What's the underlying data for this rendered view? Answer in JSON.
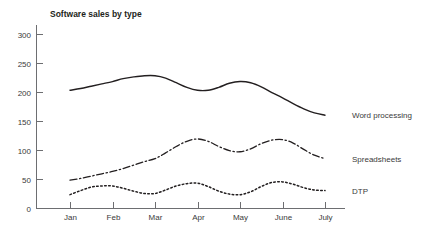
{
  "chart_data": {
    "type": "line",
    "title": "Software sales by type",
    "xlabel": "",
    "ylabel": "",
    "grid": false,
    "legend_position": "right-inline-end-of-line",
    "categories": [
      "Jan",
      "Feb",
      "Mar",
      "Apr",
      "May",
      "June",
      "July"
    ],
    "xtick_labels": [
      "Jan",
      "Feb",
      "Mar",
      "Apr",
      "May",
      "June",
      "July"
    ],
    "ytick_labels": [
      "0",
      "50",
      "100",
      "150",
      "200",
      "250",
      "300"
    ],
    "ytick_values": [
      0,
      50,
      100,
      150,
      200,
      250,
      300
    ],
    "ylim": [
      0,
      315
    ],
    "series": [
      {
        "name": "Word processing",
        "label": "Word processing",
        "line_style": "solid",
        "color": "#231f20",
        "values": [
          203,
          218,
          228,
          205,
          218,
          190,
          160
        ],
        "dense_x": [
          0,
          0.25,
          0.5,
          0.75,
          1,
          1.25,
          1.5,
          1.75,
          2,
          2.25,
          2.5,
          2.75,
          3,
          3.25,
          3.5,
          3.75,
          4,
          4.25,
          4.5,
          4.75,
          5,
          5.25,
          5.5,
          5.75,
          6
        ],
        "dense_y": [
          203,
          206,
          210,
          214,
          218,
          223,
          226,
          228,
          228,
          224,
          216,
          208,
          203,
          203,
          208,
          215,
          218,
          216,
          209,
          199,
          190,
          180,
          171,
          164,
          160
        ]
      },
      {
        "name": "Spreadsheets",
        "label": "Spreadsheets",
        "line_style": "dash-dot",
        "color": "#231f20",
        "values": [
          48,
          63,
          85,
          119,
          97,
          118,
          85
        ],
        "dense_x": [
          0,
          0.25,
          0.5,
          0.75,
          1,
          1.25,
          1.5,
          1.75,
          2,
          2.25,
          2.5,
          2.75,
          3,
          3.25,
          3.5,
          3.75,
          4,
          4.25,
          4.5,
          4.75,
          5,
          5.25,
          5.5,
          5.75,
          6
        ],
        "dense_y": [
          48,
          51,
          55,
          59,
          63,
          68,
          74,
          80,
          85,
          95,
          106,
          115,
          119,
          115,
          106,
          99,
          97,
          102,
          111,
          117,
          118,
          112,
          101,
          91,
          85
        ]
      },
      {
        "name": "DTP",
        "label": "DTP",
        "line_style": "dotted",
        "color": "#231f20",
        "values": [
          23,
          38,
          25,
          43,
          23,
          45,
          30
        ],
        "dense_x": [
          0,
          0.25,
          0.5,
          0.75,
          1,
          1.25,
          1.5,
          1.75,
          2,
          2.25,
          2.5,
          2.75,
          3,
          3.25,
          3.5,
          3.75,
          4,
          4.25,
          4.5,
          4.75,
          5,
          5.25,
          5.5,
          5.75,
          6
        ],
        "dense_y": [
          23,
          30,
          36,
          38,
          38,
          34,
          29,
          25,
          25,
          31,
          38,
          42,
          43,
          37,
          29,
          24,
          23,
          28,
          37,
          44,
          45,
          41,
          35,
          31,
          30
        ]
      }
    ],
    "axis_color": "#6d6e71",
    "text_color": "#3a3a3a",
    "title_color": "#231f20"
  }
}
